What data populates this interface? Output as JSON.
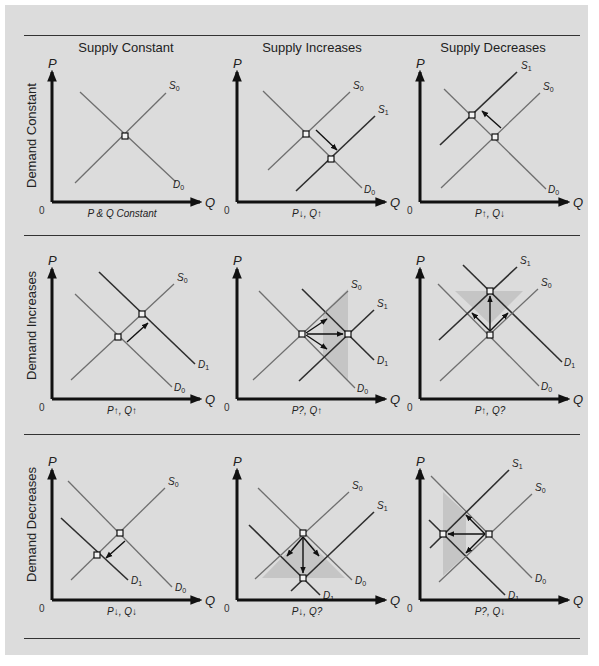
{
  "figure": {
    "column_headers": [
      "Supply Constant",
      "Supply Increases",
      "Supply Decreases"
    ],
    "row_headers": [
      "Demand Constant",
      "Demand Increases",
      "Demand Decreases"
    ],
    "axis": {
      "p_label": "P",
      "q_label": "Q",
      "origin_label": "0"
    }
  },
  "colors": {
    "background": "#dcdcdc",
    "base_curve": "#6f6f6f",
    "shifted_curve": "#2e2e2e",
    "axis": "#111111",
    "arrow": "#111111",
    "shade": "#bdbdbd",
    "rule": "#333333"
  },
  "chart_data": {
    "type": "diagram",
    "grid": false,
    "panels": [
      {
        "id": "r1c1",
        "row": "Demand Constant",
        "col": "Supply Constant",
        "origin": [
          52,
          202
        ],
        "caption": "P & Q Constant",
        "lines": [
          {
            "name": "D0",
            "sub": "0",
            "letter": "D",
            "shifted": false,
            "from": [
              28,
              -110
            ],
            "to": [
              124,
              -20
            ],
            "label_at": [
              121,
              -14
            ]
          },
          {
            "name": "S0",
            "sub": "0",
            "letter": "S",
            "shifted": false,
            "from": [
              23,
              -19
            ],
            "to": [
              114,
              -109
            ],
            "label_at": [
              117,
              -113
            ]
          }
        ],
        "equilibria": [
          [
            73,
            -66
          ]
        ],
        "arrows": [],
        "shade": []
      },
      {
        "id": "r1c2",
        "row": "Demand Constant",
        "col": "Supply Increases",
        "origin": [
          237,
          202
        ],
        "caption": "P↓, Q↑",
        "lines": [
          {
            "name": "D0",
            "sub": "0",
            "letter": "D",
            "shifted": false,
            "from": [
              26,
              -111
            ],
            "to": [
              125,
              -14
            ],
            "label_at": [
              127,
              -9
            ]
          },
          {
            "name": "S0",
            "sub": "0",
            "letter": "S",
            "shifted": false,
            "from": [
              31,
              -32
            ],
            "to": [
              113,
              -110
            ],
            "label_at": [
              116,
              -113
            ]
          },
          {
            "name": "S1",
            "sub": "1",
            "letter": "S",
            "shifted": true,
            "from": [
              59,
              -11
            ],
            "to": [
              138,
              -86
            ],
            "label_at": [
              141,
              -89
            ]
          }
        ],
        "equilibria": [
          [
            69,
            -68
          ],
          [
            94,
            -43
          ]
        ],
        "arrows": [
          [
            [
              79,
              -72
            ],
            [
              100,
              -52
            ]
          ]
        ],
        "shade": []
      },
      {
        "id": "r1c3",
        "row": "Demand Constant",
        "col": "Supply Decreases",
        "origin": [
          420,
          202
        ],
        "caption": "P↑, Q↓",
        "lines": [
          {
            "name": "D0",
            "sub": "0",
            "letter": "D",
            "shifted": false,
            "from": [
              24,
              -113
            ],
            "to": [
              126,
              -13
            ],
            "label_at": [
              128,
              -9
            ]
          },
          {
            "name": "S0",
            "sub": "0",
            "letter": "S",
            "shifted": false,
            "from": [
              21,
              -14
            ],
            "to": [
              120,
              -109
            ],
            "label_at": [
              123,
              -112
            ]
          },
          {
            "name": "S1",
            "sub": "1",
            "letter": "S",
            "shifted": true,
            "from": [
              20,
              -57
            ],
            "to": [
              97,
              -130
            ],
            "label_at": [
              101,
              -133
            ]
          }
        ],
        "equilibria": [
          [
            75,
            -65
          ],
          [
            52,
            -87
          ]
        ],
        "arrows": [
          [
            [
              81,
              -74
            ],
            [
              62,
              -91
            ]
          ]
        ],
        "shade": []
      },
      {
        "id": "r2c1",
        "row": "Demand Increases",
        "col": "Supply Constant",
        "origin": [
          52,
          399
        ],
        "caption": "P↑, Q↑",
        "lines": [
          {
            "name": "D0",
            "sub": "0",
            "letter": "D",
            "shifted": false,
            "from": [
              23,
              -105
            ],
            "to": [
              120,
              -12
            ],
            "label_at": [
              122,
              -8
            ]
          },
          {
            "name": "D1",
            "sub": "1",
            "letter": "D",
            "shifted": true,
            "from": [
              47,
              -127
            ],
            "to": [
              143,
              -35
            ],
            "label_at": [
              146,
              -31
            ]
          },
          {
            "name": "S0",
            "sub": "0",
            "letter": "S",
            "shifted": false,
            "from": [
              19,
              -19
            ],
            "to": [
              122,
              -115
            ],
            "label_at": [
              125,
              -118
            ]
          }
        ],
        "equilibria": [
          [
            66,
            -62
          ],
          [
            90,
            -85
          ]
        ],
        "arrows": [
          [
            [
              75,
              -57
            ],
            [
              96,
              -76
            ]
          ]
        ],
        "shade": []
      },
      {
        "id": "r2c2",
        "row": "Demand Increases",
        "col": "Supply Increases",
        "origin": [
          237,
          399
        ],
        "caption": "P?, Q↑",
        "lines": [
          {
            "name": "D0",
            "sub": "0",
            "letter": "D",
            "shifted": false,
            "from": [
              22,
              -108
            ],
            "to": [
              118,
              -11
            ],
            "label_at": [
              120,
              -7
            ]
          },
          {
            "name": "D1",
            "sub": "1",
            "letter": "D",
            "shifted": true,
            "from": [
              65,
              -110
            ],
            "to": [
              137,
              -39
            ],
            "label_at": [
              140,
              -35
            ]
          },
          {
            "name": "S0",
            "sub": "0",
            "letter": "S",
            "shifted": false,
            "from": [
              16,
              -19
            ],
            "to": [
              111,
              -108
            ],
            "label_at": [
              114,
              -111
            ]
          },
          {
            "name": "S1",
            "sub": "1",
            "letter": "S",
            "shifted": true,
            "from": [
              62,
              -18
            ],
            "to": [
              137,
              -89
            ],
            "label_at": [
              140,
              -92
            ]
          }
        ],
        "equilibria": [
          [
            65,
            -65
          ],
          [
            111,
            -65
          ]
        ],
        "arrows": [
          [
            [
              69,
              -66
            ],
            [
              90,
              -80
            ]
          ],
          [
            [
              70,
              -65
            ],
            [
              106,
              -65
            ]
          ],
          [
            [
              69,
              -64
            ],
            [
              90,
              -50
            ]
          ]
        ],
        "shade": [
          [
            86,
            -86
          ],
          [
            111,
            -110
          ],
          [
            111,
            -19
          ],
          [
            86,
            -43
          ]
        ]
      },
      {
        "id": "r2c3",
        "row": "Demand Increases",
        "col": "Supply Decreases",
        "origin": [
          420,
          399
        ],
        "caption": "P↑, Q?",
        "lines": [
          {
            "name": "D0",
            "sub": "0",
            "letter": "D",
            "shifted": false,
            "from": [
              18,
              -115
            ],
            "to": [
              119,
              -13
            ],
            "label_at": [
              121,
              -9
            ]
          },
          {
            "name": "D1",
            "sub": "1",
            "letter": "D",
            "shifted": true,
            "from": [
              43,
              -134
            ],
            "to": [
              142,
              -37
            ],
            "label_at": [
              144,
              -33
            ]
          },
          {
            "name": "S0",
            "sub": "0",
            "letter": "S",
            "shifted": false,
            "from": [
              20,
              -18
            ],
            "to": [
              118,
              -110
            ],
            "label_at": [
              121,
              -113
            ]
          },
          {
            "name": "S1",
            "sub": "1",
            "letter": "S",
            "shifted": true,
            "from": [
              19,
              -59
            ],
            "to": [
              97,
              -132
            ],
            "label_at": [
              100,
              -135
            ]
          }
        ],
        "equilibria": [
          [
            70,
            -64
          ],
          [
            70,
            -108
          ]
        ],
        "arrows": [
          [
            [
              70,
              -68
            ],
            [
              70,
              -103
            ]
          ],
          [
            [
              70,
              -68
            ],
            [
              52,
              -86
            ]
          ],
          [
            [
              70,
              -68
            ],
            [
              88,
              -86
            ]
          ]
        ],
        "shade": [
          [
            35,
            -108
          ],
          [
            103,
            -108
          ],
          [
            70,
            -75
          ]
        ]
      },
      {
        "id": "r3c1",
        "row": "Demand Decreases",
        "col": "Supply Constant",
        "origin": [
          52,
          600
        ],
        "caption": "P↓, Q↓",
        "lines": [
          {
            "name": "D0",
            "sub": "0",
            "letter": "D",
            "shifted": false,
            "from": [
              16,
              -119
            ],
            "to": [
              120,
              -13
            ],
            "label_at": [
              123,
              -9
            ]
          },
          {
            "name": "D1",
            "sub": "1",
            "letter": "D",
            "shifted": true,
            "from": [
              9,
              -82
            ],
            "to": [
              76,
              -20
            ],
            "label_at": [
              79,
              -16
            ]
          },
          {
            "name": "S0",
            "sub": "0",
            "letter": "S",
            "shifted": false,
            "from": [
              19,
              -20
            ],
            "to": [
              113,
              -112
            ],
            "label_at": [
              116,
              -115
            ]
          }
        ],
        "equilibria": [
          [
            68,
            -67
          ],
          [
            45,
            -45
          ]
        ],
        "arrows": [
          [
            [
              73,
              -59
            ],
            [
              54,
              -42
            ]
          ]
        ],
        "shade": []
      },
      {
        "id": "r3c2",
        "row": "Demand Decreases",
        "col": "Supply Increases",
        "origin": [
          237,
          600
        ],
        "caption": "P↓, Q?",
        "lines": [
          {
            "name": "D0",
            "sub": "0",
            "letter": "D",
            "shifted": false,
            "from": [
              21,
              -112
            ],
            "to": [
              115,
              -20
            ],
            "label_at": [
              118,
              -16
            ]
          },
          {
            "name": "D1",
            "sub": "1",
            "letter": "D",
            "shifted": true,
            "from": [
              12,
              -75
            ],
            "to": [
              83,
              -5
            ],
            "label_at": [
              86,
              -1
            ]
          },
          {
            "name": "S0",
            "sub": "0",
            "letter": "S",
            "shifted": false,
            "from": [
              18,
              -21
            ],
            "to": [
              112,
              -108
            ],
            "label_at": [
              115,
              -111
            ]
          },
          {
            "name": "S1",
            "sub": "1",
            "letter": "S",
            "shifted": true,
            "from": [
              54,
              -9
            ],
            "to": [
              137,
              -88
            ],
            "label_at": [
              140,
              -91
            ]
          }
        ],
        "equilibria": [
          [
            66,
            -67
          ],
          [
            66,
            -22
          ]
        ],
        "arrows": [
          [
            [
              66,
              -63
            ],
            [
              66,
              -27
            ]
          ],
          [
            [
              66,
              -63
            ],
            [
              50,
              -44
            ]
          ],
          [
            [
              66,
              -63
            ],
            [
              82,
              -44
            ]
          ]
        ],
        "shade": [
          [
            25,
            -22
          ],
          [
            108,
            -22
          ],
          [
            66,
            -64
          ]
        ]
      },
      {
        "id": "r3c3",
        "row": "Demand Decreases",
        "col": "Supply Decreases",
        "origin": [
          420,
          600
        ],
        "caption": "P?, Q↓",
        "lines": [
          {
            "name": "D0",
            "sub": "0",
            "letter": "D",
            "shifted": false,
            "from": [
              11,
              -124
            ],
            "to": [
              112,
              -22
            ],
            "label_at": [
              115,
              -18
            ]
          },
          {
            "name": "D1",
            "sub": "1",
            "letter": "D",
            "shifted": true,
            "from": [
              9,
              -80
            ],
            "to": [
              85,
              -5
            ],
            "label_at": [
              88,
              -1
            ]
          },
          {
            "name": "S0",
            "sub": "0",
            "letter": "S",
            "shifted": false,
            "from": [
              19,
              -18
            ],
            "to": [
              112,
              -106
            ],
            "label_at": [
              115,
              -109
            ]
          },
          {
            "name": "S1",
            "sub": "1",
            "letter": "S",
            "shifted": true,
            "from": [
              10,
              -52
            ],
            "to": [
              89,
              -130
            ],
            "label_at": [
              92,
              -133
            ]
          }
        ],
        "equilibria": [
          [
            69,
            -66
          ],
          [
            23,
            -66
          ]
        ],
        "arrows": [
          [
            [
              65,
              -66
            ],
            [
              28,
              -66
            ]
          ],
          [
            [
              65,
              -66
            ],
            [
              46,
              -85
            ]
          ],
          [
            [
              65,
              -66
            ],
            [
              46,
              -47
            ]
          ]
        ],
        "shade": [
          [
            23,
            -108
          ],
          [
            46,
            -87
          ],
          [
            46,
            -45
          ],
          [
            23,
            -24
          ]
        ]
      }
    ]
  }
}
